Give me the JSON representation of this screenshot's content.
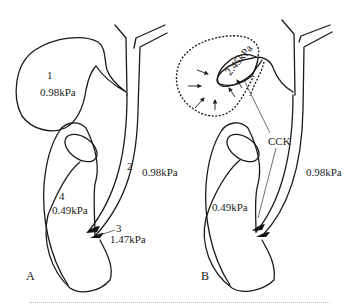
{
  "figure": {
    "panels": [
      {
        "id": "A",
        "label": "A",
        "regions": [
          {
            "number": "1",
            "pressure": "0.98kPa",
            "structure": "gallbladder"
          },
          {
            "number": "2",
            "pressure": "0.98kPa",
            "structure": "common-bile-duct"
          },
          {
            "number": "3",
            "pressure": "1.47kPa",
            "structure": "sphincter-of-oddi"
          },
          {
            "number": "4",
            "pressure": "0.49kPa",
            "structure": "duodenum"
          }
        ]
      },
      {
        "id": "B",
        "label": "B",
        "gallbladder_pressure": "2.45kPa",
        "bile_duct_pressure": "0.98kPa",
        "duodenum_pressure": "0.49kPa",
        "hormone_label": "CCK"
      }
    ],
    "colors": {
      "line": "#1a1a1a",
      "background": "#ffffff"
    }
  }
}
